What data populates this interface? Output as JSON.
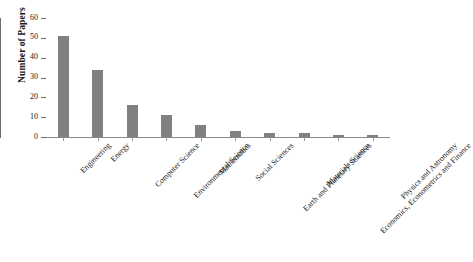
{
  "chart_data": {
    "type": "bar",
    "title": "",
    "xlabel": "",
    "ylabel": "Number of Papers",
    "ylim": [
      0,
      60
    ],
    "yticks": [
      0,
      10,
      20,
      30,
      40,
      50,
      60
    ],
    "grid": false,
    "legend": false,
    "bar_color": "#808080",
    "axis_color": "#6d6d6d",
    "categories": [
      "Engineering",
      "Energy",
      "Computer Science",
      "Environmental Science",
      "Mathematics",
      "Social Sciences",
      "Earth and Planetary Sciences",
      "Materials Science",
      "Economics, Econometrics and Finance",
      "Physics and Astronomy"
    ],
    "values": [
      51,
      34,
      16,
      11,
      6,
      3,
      2,
      2,
      1,
      1
    ]
  }
}
